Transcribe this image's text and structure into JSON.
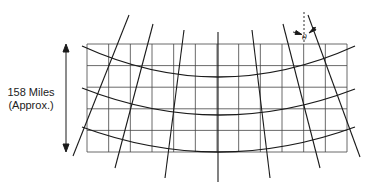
{
  "diagram": {
    "type": "map-projection-grid",
    "dimension_label": {
      "line1": "158 Miles",
      "line2": "(Approx.)"
    },
    "angle_symbol": "θ",
    "grid": {
      "x_left": 87,
      "x_right": 347,
      "y_top": 44,
      "y_bottom": 152,
      "columns": 12,
      "rows": 5
    },
    "meridians": [
      {
        "x1": 129,
        "y1": 15,
        "x2": 73,
        "y2": 156
      },
      {
        "x1": 153,
        "y1": 24,
        "x2": 115,
        "y2": 168
      },
      {
        "x1": 184,
        "y1": 30,
        "x2": 165,
        "y2": 178
      },
      {
        "x1": 218,
        "y1": 32,
        "x2": 218,
        "y2": 182
      },
      {
        "x1": 252,
        "y1": 30,
        "x2": 270,
        "y2": 178
      },
      {
        "x1": 283,
        "y1": 24,
        "x2": 320,
        "y2": 168
      },
      {
        "x1": 308,
        "y1": 15,
        "x2": 360,
        "y2": 157
      }
    ],
    "parallels": [
      {
        "left_y": 46,
        "mid_y": 77,
        "right_y": 46
      },
      {
        "left_y": 88,
        "mid_y": 115,
        "right_y": 89
      },
      {
        "left_y": 127,
        "mid_y": 152,
        "right_y": 127
      }
    ],
    "colors": {
      "line": "#1a1a1a",
      "grid": "#333333",
      "background": "#ffffff"
    }
  }
}
